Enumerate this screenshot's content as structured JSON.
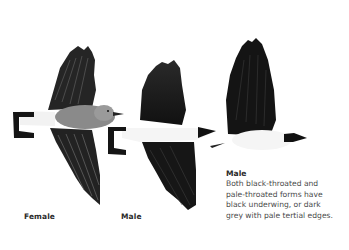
{
  "illustration": {
    "subject": "three birds in flight, viewed from below/side, black-and-white plumage",
    "colors": {
      "background": "#ffffff",
      "wing_black": "#1a1a1a",
      "female_grey": "#7a7a7a",
      "underparts_white": "#f4f4f4"
    }
  },
  "labels": {
    "female": "Female",
    "male_middle": "Male"
  },
  "caption": {
    "title": "Male",
    "lines": [
      "Both black-throated and",
      "pale-throated forms have",
      "black underwing, or dark",
      "grey with pale tertial edges."
    ]
  }
}
